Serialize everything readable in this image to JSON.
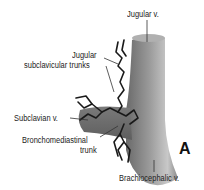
{
  "figure": {
    "panel_letter": "A",
    "labels": {
      "jugular_v": "Jugular v.",
      "jugular_line1": "Jugular",
      "jugular_line2": "subclavicular trunks",
      "subclavian_v": "Subclavian v.",
      "broncho_line1": "Bronchomediastinal",
      "broncho_line2": "trunk",
      "brachiocephalic_v": "Brachiocephalic v."
    },
    "colors": {
      "vein_dark": "#6e6e6e",
      "vein_light": "#c9c9c9",
      "lymph": "#1a1a1a"
    }
  }
}
